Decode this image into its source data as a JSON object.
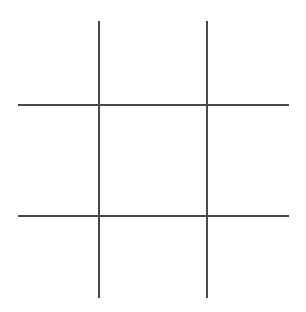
{
  "game": {
    "type": "tic-tac-toe",
    "line_color": "#4a4a4a",
    "background": "#ffffff",
    "grid": {
      "vertical_lines": [
        {
          "x": 98,
          "y1": 21,
          "y2": 298
        },
        {
          "x": 206,
          "y1": 21,
          "y2": 298
        }
      ],
      "horizontal_lines": [
        {
          "y": 104,
          "x1": 18,
          "x2": 289
        },
        {
          "y": 215,
          "x1": 18,
          "x2": 289
        }
      ]
    },
    "cells": [
      {
        "row": 0,
        "col": 0,
        "mark": ""
      },
      {
        "row": 0,
        "col": 1,
        "mark": ""
      },
      {
        "row": 0,
        "col": 2,
        "mark": ""
      },
      {
        "row": 1,
        "col": 0,
        "mark": ""
      },
      {
        "row": 1,
        "col": 1,
        "mark": ""
      },
      {
        "row": 1,
        "col": 2,
        "mark": ""
      },
      {
        "row": 2,
        "col": 0,
        "mark": ""
      },
      {
        "row": 2,
        "col": 1,
        "mark": ""
      },
      {
        "row": 2,
        "col": 2,
        "mark": ""
      }
    ]
  }
}
